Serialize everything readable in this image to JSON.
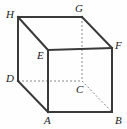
{
  "figure": {
    "name": "labeled-cube-diagram",
    "kind": "geometry-solid",
    "solid": "cube",
    "background_color": "#fefefe",
    "solid_edge_color": "#3a3a3a",
    "hidden_edge_color": "#8a8a8a",
    "label_color": "#1a1a1a",
    "solid_edge_width": 2,
    "hidden_edge_width": 1,
    "hidden_edge_dash": "2,2",
    "canvas": {
      "width": 127,
      "height": 129
    }
  },
  "vertices": [
    {
      "id": "H",
      "label": "H",
      "x": 18,
      "y": 17,
      "label_x": 6,
      "label_y": 9,
      "hidden": false
    },
    {
      "id": "G",
      "label": "G",
      "x": 82,
      "y": 17,
      "label_x": 75,
      "label_y": 3,
      "hidden": false
    },
    {
      "id": "E",
      "label": "E",
      "x": 48,
      "y": 50,
      "label_x": 37,
      "label_y": 50,
      "hidden": false
    },
    {
      "id": "F",
      "label": "F",
      "x": 112,
      "y": 48,
      "label_x": 115,
      "label_y": 40,
      "hidden": false
    },
    {
      "id": "D",
      "label": "D",
      "x": 18,
      "y": 81,
      "label_x": 6,
      "label_y": 73,
      "hidden": false
    },
    {
      "id": "C",
      "label": "C",
      "x": 82,
      "y": 81,
      "label_x": 76,
      "label_y": 84,
      "hidden": true
    },
    {
      "id": "A",
      "label": "A",
      "x": 48,
      "y": 112,
      "label_x": 44,
      "label_y": 115,
      "hidden": false
    },
    {
      "id": "B",
      "label": "B",
      "x": 112,
      "y": 112,
      "label_x": 115,
      "label_y": 115,
      "hidden": false
    }
  ],
  "edges": [
    {
      "name": "edge-H-G",
      "from": "H",
      "to": "G",
      "style": "solid"
    },
    {
      "name": "edge-H-E",
      "from": "H",
      "to": "E",
      "style": "solid"
    },
    {
      "name": "edge-H-D",
      "from": "H",
      "to": "D",
      "style": "solid"
    },
    {
      "name": "edge-G-F",
      "from": "G",
      "to": "F",
      "style": "solid"
    },
    {
      "name": "edge-E-F",
      "from": "E",
      "to": "F",
      "style": "solid"
    },
    {
      "name": "edge-E-A",
      "from": "E",
      "to": "A",
      "style": "solid"
    },
    {
      "name": "edge-F-B",
      "from": "F",
      "to": "B",
      "style": "solid"
    },
    {
      "name": "edge-D-A",
      "from": "D",
      "to": "A",
      "style": "solid"
    },
    {
      "name": "edge-A-B",
      "from": "A",
      "to": "B",
      "style": "solid"
    },
    {
      "name": "edge-G-C",
      "from": "G",
      "to": "C",
      "style": "dashed"
    },
    {
      "name": "edge-D-C",
      "from": "D",
      "to": "C",
      "style": "dashed"
    },
    {
      "name": "edge-C-B",
      "from": "C",
      "to": "B",
      "style": "dashed"
    }
  ]
}
